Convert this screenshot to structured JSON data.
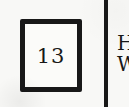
{
  "figure": {
    "numbered_box": {
      "label": "13"
    },
    "right_column": {
      "line1": "H",
      "line2": "W"
    }
  },
  "colors": {
    "ink": "#181818",
    "background": "#f8f8f6",
    "box_fill": "#fbfbf9"
  }
}
